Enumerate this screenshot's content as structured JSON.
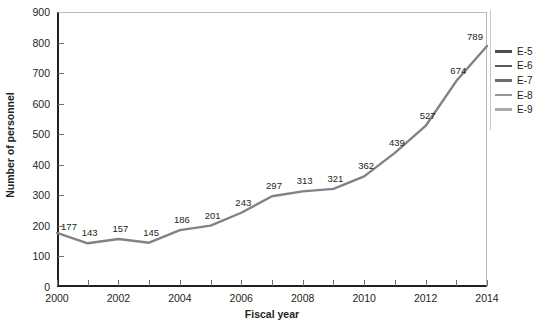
{
  "chart_data": {
    "type": "line",
    "title": "",
    "xlabel": "Fiscal year",
    "ylabel": "Number of personnel",
    "x": [
      2000,
      2001,
      2002,
      2003,
      2004,
      2005,
      2006,
      2007,
      2008,
      2009,
      2010,
      2011,
      2012,
      2013,
      2014
    ],
    "categories": [
      "2000",
      "2001",
      "2002",
      "2003",
      "2004",
      "2005",
      "2006",
      "2007",
      "2008",
      "2009",
      "2010",
      "2011",
      "2012",
      "2013",
      "2014"
    ],
    "values": [
      177,
      143,
      157,
      145,
      186,
      201,
      243,
      297,
      313,
      321,
      362,
      439,
      527,
      674,
      789
    ],
    "point_labels": [
      "177",
      "143",
      "157",
      "145",
      "186",
      "201",
      "243",
      "297",
      "313",
      "321",
      "362",
      "439",
      "527",
      "674",
      "789"
    ],
    "series": [
      {
        "name": "E-9",
        "values": [
          177,
          143,
          157,
          145,
          186,
          201,
          243,
          297,
          313,
          321,
          362,
          439,
          527,
          674,
          789
        ],
        "color": "#808285"
      }
    ],
    "ylim": [
      0,
      900
    ],
    "ytick_step": 100,
    "ytick_labels": [
      "0",
      "100",
      "200",
      "300",
      "400",
      "500",
      "600",
      "700",
      "800",
      "900"
    ],
    "ytick_values": [
      0,
      100,
      200,
      300,
      400,
      500,
      600,
      700,
      800,
      900
    ],
    "xlim": [
      2000,
      2014
    ],
    "xtick_labels": [
      "2000",
      "2002",
      "2004",
      "2006",
      "2008",
      "2010",
      "2012",
      "2014"
    ],
    "xtick_values": [
      2000,
      2002,
      2004,
      2006,
      2008,
      2010,
      2012,
      2014
    ],
    "xtick_minor_values": [
      2001,
      2003,
      2005,
      2007,
      2009,
      2011,
      2013
    ],
    "grid": false,
    "legend_position": "right",
    "legend": [
      {
        "label": "E-5",
        "color": "#4d4d4f"
      },
      {
        "label": "E-6",
        "color": "#58595b"
      },
      {
        "label": "E-7",
        "color": "#6d6e71"
      },
      {
        "label": "E-8",
        "color": "#939598"
      },
      {
        "label": "E-9",
        "color": "#a7a9ac"
      }
    ],
    "line_color": "#808285",
    "axis_color": "#231f20",
    "background_color": "#ffffff"
  }
}
